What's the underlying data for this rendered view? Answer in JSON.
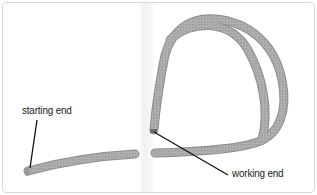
{
  "figure": {
    "labels": {
      "starting_end": "starting end",
      "working_end": "working end"
    },
    "colors": {
      "background": "#ffffff",
      "border": "#d9d9d9",
      "rope": "#a8a8a8",
      "rope_shadow": "#8c8c8c",
      "leader_line": "#111111",
      "text": "#1a1a1a"
    }
  }
}
